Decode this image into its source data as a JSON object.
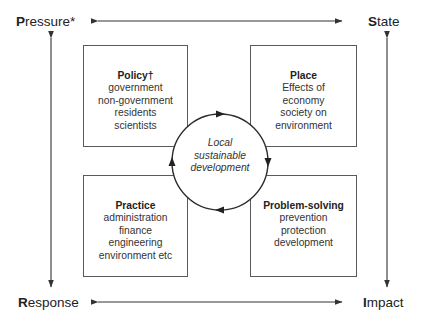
{
  "corners": {
    "pressure": {
      "initial": "P",
      "rest": "ressure*"
    },
    "state": {
      "initial": "S",
      "rest": "tate"
    },
    "response": {
      "initial": "R",
      "rest": "esponse"
    },
    "impact": {
      "initial": "I",
      "rest": "mpact"
    }
  },
  "boxes": {
    "policy": {
      "title": "Policy†",
      "lines": [
        "government",
        "non-government",
        "residents",
        "scientists"
      ]
    },
    "place": {
      "title": "Place",
      "lines": [
        "Effects of",
        "economy",
        "society on",
        "environment"
      ]
    },
    "practice": {
      "title": "Practice",
      "lines": [
        "administration",
        "finance",
        "engineering",
        "environment etc"
      ]
    },
    "problem_solving": {
      "title": "Problem-solving",
      "lines": [
        "prevention",
        "protection",
        "development"
      ]
    }
  },
  "center": {
    "lines": [
      "Local",
      "sustainable",
      "development"
    ]
  },
  "colors": {
    "line": "#3c3c3c",
    "box_border": "#5a5a5a",
    "text": "#222222"
  }
}
